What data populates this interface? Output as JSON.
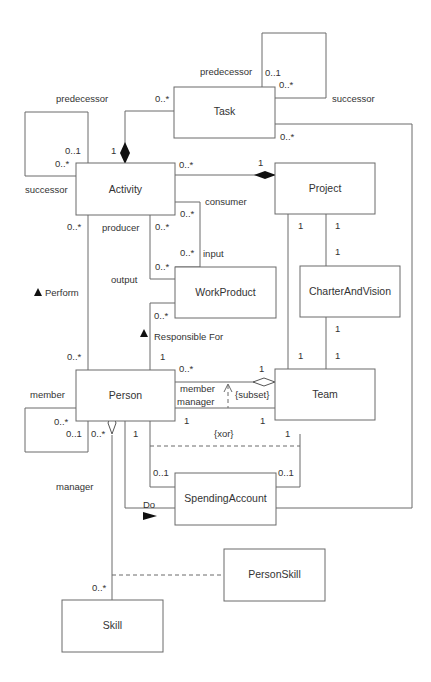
{
  "diagram": {
    "classes": {
      "task": "Task",
      "activity": "Activity",
      "project": "Project",
      "work_product": "WorkProduct",
      "charter_and_vision": "CharterAndVision",
      "person": "Person",
      "team": "Team",
      "spending_account": "SpendingAccount",
      "person_skill": "PersonSkill",
      "skill": "Skill"
    },
    "roles": {
      "task_predecessor": "predecessor",
      "task_successor": "successor",
      "activity_predecessor": "predecessor",
      "activity_successor": "successor",
      "consumer": "consumer",
      "producer": "producer",
      "input": "input",
      "output": "output",
      "team_member": "member",
      "team_manager": "manager",
      "person_member": "member",
      "person_manager": "manager"
    },
    "associations": {
      "perform": "Perform",
      "responsible_for": "Responsible For",
      "do": "Do"
    },
    "constraints": {
      "subset": "{subset}",
      "xor": "{xor}"
    },
    "multiplicities": {
      "task_self_top": "0..1",
      "task_self_bottom": "0..*",
      "task_activity_task": "0..*",
      "task_activity_activity": "1",
      "task_do": "0..*",
      "activity_self_top": "0..1",
      "activity_self_bottom": "0..*",
      "activity_project": "0..*",
      "project_activity": "1",
      "consumer_activity": "0..*",
      "producer_activity": "0..*",
      "input_wp": "0..*",
      "output_wp": "0..*",
      "activity_perform": "0..*",
      "person_perform": "0..*",
      "wp_responsible": "0..*",
      "person_responsible": "1",
      "project_team": "1",
      "project_charter": "1",
      "charter_project": "1",
      "charter_team": "1",
      "team_charter": "1",
      "team_project": "1",
      "team_member_person": "0..*",
      "team_member_team": "1",
      "team_manager_person": "1",
      "team_manager_team": "1",
      "person_self_top": "0..*",
      "person_self_bottom": "0..1",
      "person_skill": "0..*",
      "person_spending": "1",
      "team_spending": "1",
      "spending_person": "0..1",
      "spending_team": "0..1",
      "skill_person": "0..*"
    }
  }
}
